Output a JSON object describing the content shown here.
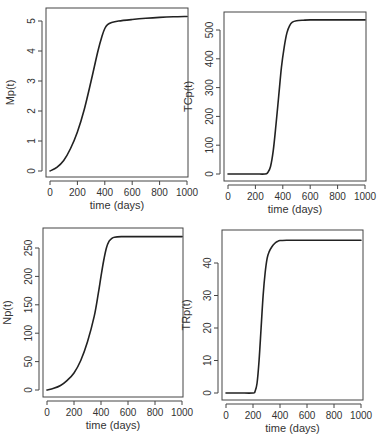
{
  "chart_data": [
    {
      "type": "line",
      "title": "",
      "xlabel": "time (days)",
      "ylabel": "Mp(t)",
      "xlim": [
        0,
        1000
      ],
      "ylim": [
        0,
        5.2
      ],
      "x_ticks": [
        0,
        200,
        400,
        600,
        800,
        1000
      ],
      "y_ticks": [
        0,
        1,
        2,
        3,
        4,
        5
      ],
      "grid": false,
      "series": [
        {
          "name": "Mp(t)",
          "x": [
            0,
            50,
            100,
            150,
            200,
            250,
            300,
            350,
            380,
            400,
            420,
            450,
            500,
            600,
            700,
            800,
            900,
            1000
          ],
          "y": [
            0,
            0.12,
            0.35,
            0.75,
            1.3,
            2.05,
            3.0,
            4.0,
            4.5,
            4.75,
            4.88,
            4.95,
            5.0,
            5.05,
            5.09,
            5.12,
            5.14,
            5.15
          ]
        }
      ]
    },
    {
      "type": "line",
      "title": "",
      "xlabel": "time (days)",
      "ylabel": "TCp(t)",
      "xlim": [
        0,
        1000
      ],
      "ylim": [
        0,
        540
      ],
      "x_ticks": [
        0,
        200,
        400,
        600,
        800,
        1000
      ],
      "y_ticks": [
        0,
        100,
        200,
        300,
        400,
        500
      ],
      "grid": false,
      "series": [
        {
          "name": "TCp(t)",
          "x": [
            0,
            100,
            200,
            270,
            290,
            310,
            330,
            350,
            370,
            390,
            410,
            430,
            450,
            470,
            500,
            550,
            600,
            800,
            1000
          ],
          "y": [
            0,
            0,
            0,
            0,
            5,
            25,
            80,
            170,
            270,
            370,
            440,
            490,
            515,
            527,
            532,
            534,
            535,
            535,
            535
          ]
        }
      ]
    },
    {
      "type": "line",
      "title": "",
      "xlabel": "time (days)",
      "ylabel": "Np(t)",
      "xlim": [
        0,
        1000
      ],
      "ylim": [
        0,
        275
      ],
      "x_ticks": [
        0,
        200,
        400,
        600,
        800,
        1000
      ],
      "y_ticks": [
        0,
        50,
        100,
        150,
        200,
        250
      ],
      "grid": false,
      "series": [
        {
          "name": "Np(t)",
          "x": [
            0,
            50,
            100,
            150,
            200,
            250,
            300,
            350,
            380,
            400,
            420,
            440,
            460,
            480,
            500,
            550,
            600,
            800,
            1000
          ],
          "y": [
            0,
            3,
            8,
            17,
            30,
            52,
            85,
            130,
            170,
            200,
            228,
            250,
            262,
            267,
            269,
            270,
            270,
            270,
            270
          ]
        }
      ]
    },
    {
      "type": "line",
      "title": "",
      "xlabel": "time (days)",
      "ylabel": "TRp(t)",
      "xlim": [
        0,
        1000
      ],
      "ylim": [
        0,
        48
      ],
      "x_ticks": [
        0,
        200,
        400,
        600,
        800,
        1000
      ],
      "y_ticks": [
        0,
        10,
        20,
        30,
        40
      ],
      "grid": false,
      "series": [
        {
          "name": "TRp(t)",
          "x": [
            0,
            100,
            200,
            215,
            230,
            245,
            260,
            275,
            290,
            305,
            320,
            340,
            360,
            380,
            400,
            450,
            500,
            700,
            1000
          ],
          "y": [
            0,
            0,
            0,
            0.5,
            3,
            10,
            20,
            30,
            37,
            41.5,
            43.5,
            45,
            46,
            46.6,
            46.9,
            47,
            47,
            47,
            47
          ]
        }
      ]
    }
  ],
  "panels": [
    {
      "ylabel": "Mp(t)",
      "xlabel": "time (days)",
      "box": {
        "x": 46,
        "y": 8,
        "w": 142,
        "h": 169
      },
      "map": {
        "x0": 50,
        "x1": 187,
        "y0": 171,
        "yk": 30
      },
      "x_tick_labels": [
        "0",
        "200",
        "400",
        "600",
        "800",
        "1000"
      ],
      "y_tick_labels": [
        "0",
        "1",
        "2",
        "3",
        "4",
        "5"
      ]
    },
    {
      "ylabel": "TCp(t)",
      "xlabel": "time (days)",
      "box": {
        "x": 224,
        "y": 12,
        "w": 142,
        "h": 169
      },
      "map": {
        "x0": 228,
        "x1": 365,
        "y0": 174,
        "yk": 0.288
      },
      "x_tick_labels": [
        "0",
        "200",
        "400",
        "600",
        "800",
        "1000"
      ],
      "y_tick_labels": [
        "0",
        "100",
        "200",
        "300",
        "400",
        "500"
      ]
    },
    {
      "ylabel": "Np(t)",
      "xlabel": "time (days)",
      "box": {
        "x": 43,
        "y": 228,
        "w": 140,
        "h": 169
      },
      "map": {
        "x0": 47,
        "x1": 182,
        "y0": 390,
        "yk": 0.568
      },
      "x_tick_labels": [
        "0",
        "200",
        "400",
        "600",
        "800",
        "1000"
      ],
      "y_tick_labels": [
        "0",
        "50",
        "100",
        "150",
        "200",
        "250"
      ]
    },
    {
      "ylabel": "TRp(t)",
      "xlabel": "time (days)",
      "box": {
        "x": 222,
        "y": 230,
        "w": 141,
        "h": 170
      },
      "map": {
        "x0": 226,
        "x1": 361,
        "y0": 393,
        "yk": 3.25
      },
      "x_tick_labels": [
        "0",
        "200",
        "400",
        "600",
        "800",
        "1000"
      ],
      "y_tick_labels": [
        "0",
        "10",
        "20",
        "30",
        "40"
      ]
    }
  ],
  "colors": {
    "line": "#222222",
    "axis": "#444444",
    "text": "#333333",
    "background": "#ffffff"
  }
}
